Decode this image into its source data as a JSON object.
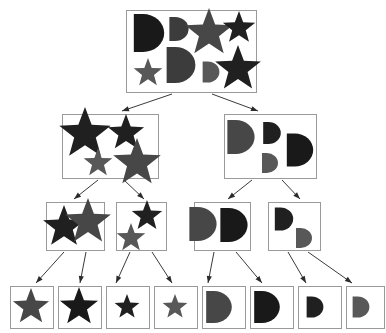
{
  "figure": {
    "type": "hierarchy-tree",
    "title": "",
    "background": "#ffffff",
    "box_stroke": "#9a9a9a",
    "edge_stroke": "#3a3a3a",
    "arrow_fill": "#2b2b2b",
    "width": 386,
    "height": 333
  },
  "palette": {
    "black": "#191919",
    "near_black": "#202020",
    "dark_gray": "#3c3c3c",
    "mid_dark_gray": "#474747",
    "mid_gray": "#585858",
    "gray": "#666666"
  },
  "levels": [
    {
      "index": 0,
      "label": "root",
      "node_count": 1
    },
    {
      "index": 1,
      "label": "level-1",
      "node_count": 2
    },
    {
      "index": 2,
      "label": "level-2",
      "node_count": 4
    },
    {
      "index": 3,
      "label": "leaves",
      "node_count": 8
    }
  ],
  "nodes": [
    {
      "id": "root",
      "level": 0,
      "box": {
        "x": 126,
        "y": 10,
        "w": 130,
        "h": 82
      },
      "shape_count": 8,
      "shapes": [
        {
          "kind": "d",
          "cx": 149,
          "cy": 33,
          "size": 38,
          "color": "#191919"
        },
        {
          "kind": "d",
          "cx": 179,
          "cy": 29,
          "size": 24,
          "color": "#3c3c3c"
        },
        {
          "kind": "star",
          "cx": 209,
          "cy": 33,
          "size": 25,
          "color": "#474747"
        },
        {
          "kind": "star",
          "cx": 239,
          "cy": 28,
          "size": 17,
          "color": "#202020"
        },
        {
          "kind": "star",
          "cx": 148,
          "cy": 73,
          "size": 15,
          "color": "#585858"
        },
        {
          "kind": "d",
          "cx": 181,
          "cy": 65,
          "size": 36,
          "color": "#3c3c3c"
        },
        {
          "kind": "d",
          "cx": 211,
          "cy": 72,
          "size": 21,
          "color": "#585858"
        },
        {
          "kind": "star",
          "cx": 238,
          "cy": 69,
          "size": 24,
          "color": "#202020"
        }
      ]
    },
    {
      "id": "n-stars",
      "level": 1,
      "box": {
        "x": 62,
        "y": 114,
        "w": 96,
        "h": 64
      },
      "shape_count": 4,
      "shapes": [
        {
          "kind": "star",
          "cx": 85,
          "cy": 134,
          "size": 27,
          "color": "#202020"
        },
        {
          "kind": "star",
          "cx": 126,
          "cy": 133,
          "size": 19,
          "color": "#202020"
        },
        {
          "kind": "star",
          "cx": 98,
          "cy": 163,
          "size": 15,
          "color": "#585858"
        },
        {
          "kind": "star",
          "cx": 137,
          "cy": 163,
          "size": 25,
          "color": "#474747"
        }
      ]
    },
    {
      "id": "n-ds",
      "level": 1,
      "box": {
        "x": 224,
        "y": 114,
        "w": 92,
        "h": 64
      },
      "shape_count": 4,
      "shapes": [
        {
          "kind": "d",
          "cx": 241,
          "cy": 137,
          "size": 34,
          "color": "#474747"
        },
        {
          "kind": "d",
          "cx": 272,
          "cy": 133,
          "size": 22,
          "color": "#202020"
        },
        {
          "kind": "d",
          "cx": 270,
          "cy": 163,
          "size": 20,
          "color": "#585858"
        },
        {
          "kind": "d",
          "cx": 300,
          "cy": 150,
          "size": 33,
          "color": "#191919"
        }
      ]
    },
    {
      "id": "n-stars-big",
      "level": 2,
      "box": {
        "x": 46,
        "y": 202,
        "w": 58,
        "h": 48
      },
      "shape_count": 2,
      "shapes": [
        {
          "kind": "star",
          "cx": 64,
          "cy": 227,
          "size": 22,
          "color": "#202020"
        },
        {
          "kind": "star",
          "cx": 88,
          "cy": 222,
          "size": 24,
          "color": "#474747"
        }
      ]
    },
    {
      "id": "n-stars-small",
      "level": 2,
      "box": {
        "x": 116,
        "y": 202,
        "w": 50,
        "h": 48
      },
      "shape_count": 2,
      "shapes": [
        {
          "kind": "star",
          "cx": 147,
          "cy": 216,
          "size": 16,
          "color": "#202020"
        },
        {
          "kind": "star",
          "cx": 131,
          "cy": 238,
          "size": 15,
          "color": "#585858"
        }
      ]
    },
    {
      "id": "n-ds-big",
      "level": 2,
      "box": {
        "x": 194,
        "y": 202,
        "w": 56,
        "h": 48
      },
      "shape_count": 2,
      "shapes": [
        {
          "kind": "d",
          "cx": 203,
          "cy": 224,
          "size": 34,
          "color": "#474747"
        },
        {
          "kind": "d",
          "cx": 234,
          "cy": 225,
          "size": 34,
          "color": "#191919"
        }
      ]
    },
    {
      "id": "n-ds-small",
      "level": 2,
      "box": {
        "x": 268,
        "y": 202,
        "w": 52,
        "h": 48
      },
      "shape_count": 2,
      "shapes": [
        {
          "kind": "d",
          "cx": 284,
          "cy": 219,
          "size": 23,
          "color": "#202020"
        },
        {
          "kind": "d",
          "cx": 304,
          "cy": 238,
          "size": 20,
          "color": "#585858"
        }
      ]
    },
    {
      "id": "leaf-1",
      "level": 3,
      "box": {
        "x": 10,
        "y": 286,
        "w": 43,
        "h": 42
      },
      "shape_count": 1,
      "shapes": [
        {
          "kind": "star",
          "cx": 31,
          "cy": 307,
          "size": 19,
          "color": "#474747"
        }
      ]
    },
    {
      "id": "leaf-2",
      "level": 3,
      "box": {
        "x": 58,
        "y": 286,
        "w": 43,
        "h": 42
      },
      "shape_count": 1,
      "shapes": [
        {
          "kind": "star",
          "cx": 79,
          "cy": 307,
          "size": 20,
          "color": "#191919"
        }
      ]
    },
    {
      "id": "leaf-3",
      "level": 3,
      "box": {
        "x": 106,
        "y": 286,
        "w": 43,
        "h": 42
      },
      "shape_count": 1,
      "shapes": [
        {
          "kind": "star",
          "cx": 127,
          "cy": 307,
          "size": 13,
          "color": "#202020"
        }
      ]
    },
    {
      "id": "leaf-4",
      "level": 3,
      "box": {
        "x": 154,
        "y": 286,
        "w": 43,
        "h": 42
      },
      "shape_count": 1,
      "shapes": [
        {
          "kind": "star",
          "cx": 175,
          "cy": 307,
          "size": 13,
          "color": "#585858"
        }
      ]
    },
    {
      "id": "leaf-5",
      "level": 3,
      "box": {
        "x": 202,
        "y": 286,
        "w": 43,
        "h": 42
      },
      "shape_count": 1,
      "shapes": [
        {
          "kind": "d",
          "cx": 219,
          "cy": 307,
          "size": 32,
          "color": "#474747"
        }
      ]
    },
    {
      "id": "leaf-6",
      "level": 3,
      "box": {
        "x": 250,
        "y": 286,
        "w": 43,
        "h": 42
      },
      "shape_count": 1,
      "shapes": [
        {
          "kind": "d",
          "cx": 267,
          "cy": 307,
          "size": 32,
          "color": "#191919"
        }
      ]
    },
    {
      "id": "leaf-7",
      "level": 3,
      "box": {
        "x": 298,
        "y": 286,
        "w": 43,
        "h": 42
      },
      "shape_count": 1,
      "shapes": [
        {
          "kind": "d",
          "cx": 315,
          "cy": 307,
          "size": 21,
          "color": "#202020"
        }
      ]
    },
    {
      "id": "leaf-8",
      "level": 3,
      "box": {
        "x": 346,
        "y": 286,
        "w": 38,
        "h": 42
      },
      "shape_count": 1,
      "shapes": [
        {
          "kind": "d",
          "cx": 361,
          "cy": 307,
          "size": 21,
          "color": "#585858"
        }
      ]
    }
  ],
  "edges": [
    {
      "from": "root",
      "to": "n-stars",
      "x1": 172,
      "y1": 94,
      "x2": 122,
      "y2": 111
    },
    {
      "from": "root",
      "to": "n-ds",
      "x1": 212,
      "y1": 94,
      "x2": 258,
      "y2": 111
    },
    {
      "from": "n-stars",
      "to": "n-stars-big",
      "x1": 98,
      "y1": 180,
      "x2": 74,
      "y2": 199
    },
    {
      "from": "n-stars",
      "to": "n-stars-small",
      "x1": 124,
      "y1": 180,
      "x2": 144,
      "y2": 199
    },
    {
      "from": "n-ds",
      "to": "n-ds-big",
      "x1": 252,
      "y1": 180,
      "x2": 228,
      "y2": 199
    },
    {
      "from": "n-ds",
      "to": "n-ds-small",
      "x1": 282,
      "y1": 180,
      "x2": 300,
      "y2": 199
    },
    {
      "from": "n-stars-big",
      "to": "leaf-1",
      "x1": 64,
      "y1": 252,
      "x2": 36,
      "y2": 283
    },
    {
      "from": "n-stars-big",
      "to": "leaf-2",
      "x1": 86,
      "y1": 252,
      "x2": 80,
      "y2": 283
    },
    {
      "from": "n-stars-small",
      "to": "leaf-3",
      "x1": 130,
      "y1": 252,
      "x2": 116,
      "y2": 283
    },
    {
      "from": "n-stars-small",
      "to": "leaf-4",
      "x1": 152,
      "y1": 252,
      "x2": 172,
      "y2": 283
    },
    {
      "from": "n-ds-big",
      "to": "leaf-5",
      "x1": 214,
      "y1": 252,
      "x2": 208,
      "y2": 283
    },
    {
      "from": "n-ds-big",
      "to": "leaf-6",
      "x1": 236,
      "y1": 252,
      "x2": 262,
      "y2": 283
    },
    {
      "from": "n-ds-small",
      "to": "leaf-7",
      "x1": 288,
      "y1": 252,
      "x2": 306,
      "y2": 283
    },
    {
      "from": "n-ds-small",
      "to": "leaf-8",
      "x1": 308,
      "y1": 252,
      "x2": 352,
      "y2": 283
    }
  ]
}
